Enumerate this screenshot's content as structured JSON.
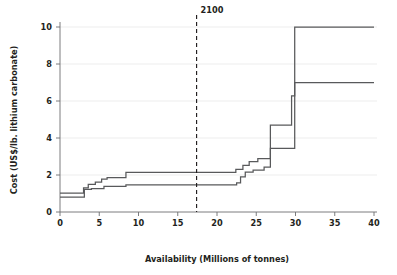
{
  "chart_data": {
    "type": "line",
    "title": "",
    "xlabel": "Availability (Millions of tonnes)",
    "ylabel": "Cost (US$/lb. lithium carbonate)",
    "xlim": [
      0,
      40
    ],
    "ylim": [
      0,
      10.4
    ],
    "xticks": [
      0,
      5,
      10,
      15,
      20,
      25,
      30,
      35,
      40
    ],
    "xtick_labels": [
      "0",
      "5",
      "10",
      "15",
      "20",
      "25",
      "30",
      "35",
      "40"
    ],
    "yticks": [
      0,
      2,
      4,
      6,
      8,
      10
    ],
    "ytick_labels": [
      "0",
      "2",
      "4",
      "6",
      "8",
      "10"
    ],
    "grid": "horizontal",
    "legend": "none",
    "line_color": "#58595b",
    "grid_color": "#e8e8e8",
    "axis_color": "#6d6e71",
    "annotations": [
      {
        "name": "year-2100-marker",
        "label": "2100",
        "x": 17.4,
        "style": "dashed-vertical-line",
        "color": "#231f20"
      }
    ],
    "series": [
      {
        "name": "upper-cost-curve",
        "step": "post",
        "points": [
          [
            0.0,
            1.02
          ],
          [
            3.0,
            1.02
          ],
          [
            3.0,
            1.3
          ],
          [
            3.6,
            1.3
          ],
          [
            3.6,
            1.5
          ],
          [
            4.5,
            1.5
          ],
          [
            4.5,
            1.62
          ],
          [
            5.3,
            1.62
          ],
          [
            5.3,
            1.78
          ],
          [
            6.0,
            1.78
          ],
          [
            6.0,
            1.86
          ],
          [
            8.4,
            1.86
          ],
          [
            8.4,
            2.14
          ],
          [
            22.4,
            2.14
          ],
          [
            22.4,
            2.3
          ],
          [
            23.3,
            2.3
          ],
          [
            23.3,
            2.52
          ],
          [
            24.1,
            2.52
          ],
          [
            24.1,
            2.72
          ],
          [
            25.2,
            2.72
          ],
          [
            25.2,
            2.88
          ],
          [
            26.8,
            2.88
          ],
          [
            26.8,
            4.7
          ],
          [
            29.5,
            4.7
          ],
          [
            29.5,
            6.28
          ],
          [
            29.9,
            6.28
          ],
          [
            29.9,
            10.0
          ],
          [
            40.0,
            10.0
          ]
        ]
      },
      {
        "name": "lower-cost-curve",
        "step": "post",
        "points": [
          [
            0.0,
            0.8
          ],
          [
            3.1,
            0.8
          ],
          [
            3.1,
            1.22
          ],
          [
            4.0,
            1.22
          ],
          [
            4.0,
            1.26
          ],
          [
            5.6,
            1.26
          ],
          [
            5.6,
            1.38
          ],
          [
            8.4,
            1.38
          ],
          [
            8.4,
            1.46
          ],
          [
            22.5,
            1.46
          ],
          [
            22.5,
            1.58
          ],
          [
            23.0,
            1.58
          ],
          [
            23.0,
            1.9
          ],
          [
            23.6,
            1.9
          ],
          [
            23.6,
            2.16
          ],
          [
            24.6,
            2.16
          ],
          [
            24.6,
            2.26
          ],
          [
            26.0,
            2.26
          ],
          [
            26.0,
            2.42
          ],
          [
            26.8,
            2.42
          ],
          [
            26.8,
            3.44
          ],
          [
            29.9,
            3.44
          ],
          [
            29.9,
            5.0
          ],
          [
            29.9,
            7.0
          ],
          [
            40.0,
            7.0
          ]
        ]
      }
    ]
  }
}
